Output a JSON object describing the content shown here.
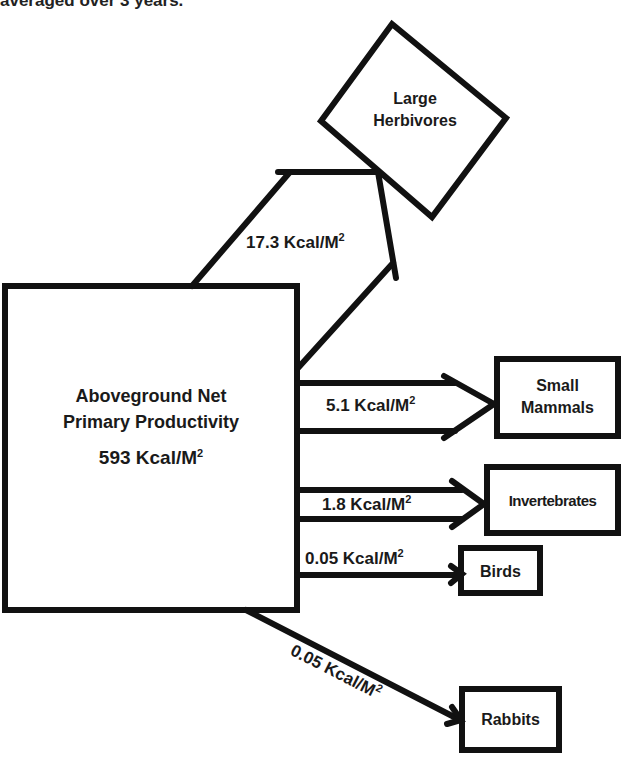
{
  "caption": "averaged over 3 years.",
  "source": {
    "line1": "Aboveground Net",
    "line2": "Primary Productivity",
    "value": "593 Kcal/M",
    "value_sup": "2"
  },
  "consumers": {
    "large_herbivores": {
      "line1": "Large",
      "line2": "Herbivores",
      "flow": "17.3 Kcal/M",
      "flow_sup": "2"
    },
    "small_mammals": {
      "line1": "Small",
      "line2": "Mammals",
      "flow": "5.1 Kcal/M",
      "flow_sup": "2"
    },
    "invertebrates": {
      "line1": "Invertebrates",
      "flow": "1.8 Kcal/M",
      "flow_sup": "2"
    },
    "birds": {
      "line1": "Birds",
      "flow": "0.05 Kcal/M",
      "flow_sup": "2"
    },
    "rabbits": {
      "line1": "Rabbits",
      "flow": "0.05 Kcal/M",
      "flow_sup": "2"
    }
  },
  "colors": {
    "stroke": "#111111",
    "background": "#ffffff"
  }
}
